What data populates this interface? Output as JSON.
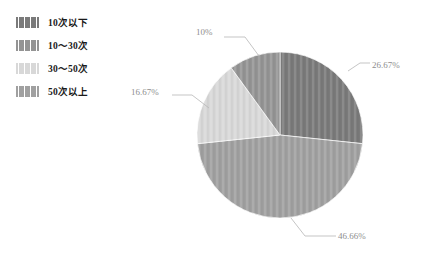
{
  "legend": {
    "items": [
      {
        "label": "10次以下",
        "color": "#7a7a7a",
        "swatch_name": "legend-swatch-10-or-less"
      },
      {
        "label": "10～30次",
        "color": "#949494",
        "swatch_name": "legend-swatch-10-to-30"
      },
      {
        "label": "30～50次",
        "color": "#d8d8d8",
        "swatch_name": "legend-swatch-30-to-50"
      },
      {
        "label": "50次以上",
        "color": "#a0a0a0",
        "swatch_name": "legend-swatch-50-or-more"
      }
    ]
  },
  "chart_data": {
    "type": "pie",
    "title": "",
    "subtitle": "",
    "xlabel": "",
    "ylabel": "",
    "grid": false,
    "legend_position": "top-left",
    "start_angle_deg": 0,
    "direction": "clockwise",
    "center": {
      "x": 280,
      "y": 135
    },
    "radius": 83,
    "categories": [
      "10次以下",
      "10～30次",
      "30～50次",
      "50次以上"
    ],
    "values": [
      26.67,
      10,
      16.67,
      46.66
    ],
    "slices": [
      {
        "category": "10次以下",
        "value": 26.67,
        "label": "26.67%",
        "color": "#7a7a7a",
        "start_deg": 0,
        "end_deg": 96.0,
        "leader_from": {
          "x": 348,
          "y": 71
        },
        "leader_mid": {
          "x": 360,
          "y": 63
        },
        "leader_to": {
          "x": 370,
          "y": 63
        }
      },
      {
        "category": "50次以上",
        "value": 46.66,
        "label": "46.66%",
        "color": "#a0a0a0",
        "start_deg": 96.0,
        "end_deg": 264.0,
        "leader_from": {
          "x": 291,
          "y": 218
        },
        "leader_mid": {
          "x": 305,
          "y": 236
        },
        "leader_to": {
          "x": 336,
          "y": 236
        }
      },
      {
        "category": "30～50次",
        "value": 16.67,
        "label": "16.67%",
        "color": "#d8d8d8",
        "start_deg": 264.0,
        "end_deg": 324.0,
        "leader_from": {
          "x": 209,
          "y": 108
        },
        "leader_mid": {
          "x": 192,
          "y": 95
        },
        "leader_to": {
          "x": 172,
          "y": 95
        }
      },
      {
        "category": "10～30次",
        "value": 10,
        "label": "10%",
        "color": "#949494",
        "start_deg": 324.0,
        "end_deg": 360.0,
        "leader_from": {
          "x": 259,
          "y": 56
        },
        "leader_mid": {
          "x": 245,
          "y": 37
        },
        "leader_to": {
          "x": 224,
          "y": 37
        }
      }
    ]
  }
}
